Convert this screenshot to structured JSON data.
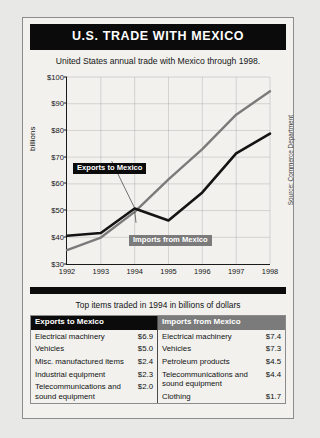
{
  "figure": {
    "title": "U.S. TRADE WITH MEXICO",
    "subtitle": "United States annual trade with Mexico through 1998.",
    "source": "Source: Commerce Department",
    "tables_caption": "Top items traded in 1994 in billions of dollars"
  },
  "chart_data": {
    "type": "line",
    "title": "U.S. TRADE WITH MEXICO",
    "subtitle": "United States annual trade with Mexico through 1998.",
    "xlabel": "",
    "ylabel": "billions",
    "x": [
      1992,
      1993,
      1994,
      1995,
      1996,
      1997,
      1998
    ],
    "xticklabels": [
      "1992",
      "1993",
      "1994",
      "1995",
      "1996",
      "1997",
      "1998"
    ],
    "yticklabels": [
      "$30",
      "$40",
      "$50",
      "$60",
      "$70",
      "$80",
      "$90",
      "$100"
    ],
    "yticks": [
      30,
      40,
      50,
      60,
      70,
      80,
      90,
      100
    ],
    "ylim": [
      30,
      100
    ],
    "grid": true,
    "legend": "inline-callouts",
    "series": [
      {
        "name": "Exports to Mexico",
        "color": "#141414",
        "values": [
          40.6,
          41.6,
          50.8,
          46.3,
          56.8,
          71.4,
          78.8
        ]
      },
      {
        "name": "Imports from Mexico",
        "color": "#7b7b7b",
        "values": [
          35.2,
          39.9,
          49.5,
          61.7,
          73.0,
          85.9,
          94.7
        ]
      }
    ],
    "annotations": [
      {
        "text": "Exports to Mexico",
        "style": "black-box-white-text"
      },
      {
        "text": "Imports from Mexico",
        "style": "grey-box-white-text"
      }
    ],
    "source": "Source: Commerce Department"
  },
  "tables": {
    "exports": {
      "header": "Exports to Mexico",
      "rows": [
        {
          "item": "Electrical machinery",
          "value": "$6.9"
        },
        {
          "item": "Vehicles",
          "value": "$5.0"
        },
        {
          "item": "Misc. manufactured items",
          "value": "$2.4"
        },
        {
          "item": "Industrial equipment",
          "value": "$2.3"
        },
        {
          "item": "Telecommunications and sound equipment",
          "value": "$2.0"
        }
      ]
    },
    "imports": {
      "header": "Imports from Mexico",
      "rows": [
        {
          "item": "Electrical machinery",
          "value": "$7.4"
        },
        {
          "item": "Vehicles",
          "value": "$7.3"
        },
        {
          "item": "Petroleum products",
          "value": "$4.5"
        },
        {
          "item": "Telecommunications and sound equipment",
          "value": "$4.4"
        },
        {
          "item": "Clothing",
          "value": "$1.7"
        }
      ]
    }
  }
}
